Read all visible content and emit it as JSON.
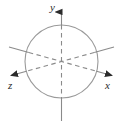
{
  "figure": {
    "name": "3d-coordinate-axes-with-sphere",
    "background_color": "#ffffff",
    "line_color": "#8a8a8a",
    "dashed_line_color": "#8a8a8a",
    "arrow_color": "#2b2b2b",
    "label_color": "#2b2b2b",
    "circle": {
      "name": "sphere-outline",
      "center_x": 61.5,
      "center_y": 61.5,
      "radius": 36.5,
      "stroke_width": 1
    },
    "axes": [
      {
        "id": "y-axis",
        "label": "y",
        "direction": "vertical",
        "arrow": "up",
        "solid_outside_circle": true,
        "dashed_inside_circle": true,
        "top_point": [
          61.5,
          11
        ],
        "bottom_point": [
          61.5,
          120
        ]
      },
      {
        "id": "x-axis",
        "label": "x",
        "direction": "oblique-lower-right",
        "arrow": "lower-right",
        "solid_outside_circle": true,
        "dashed_inside_circle": true,
        "tip_point": [
          114,
          76
        ],
        "back_point": [
          9,
          47
        ]
      },
      {
        "id": "z-axis",
        "label": "z",
        "direction": "oblique-lower-left",
        "arrow": "lower-left",
        "solid_outside_circle": true,
        "dashed_inside_circle": true,
        "tip_point": [
          9,
          76
        ],
        "back_point": [
          114,
          47
        ]
      }
    ],
    "labels": {
      "y": "y",
      "x": "x",
      "z": "z"
    }
  }
}
